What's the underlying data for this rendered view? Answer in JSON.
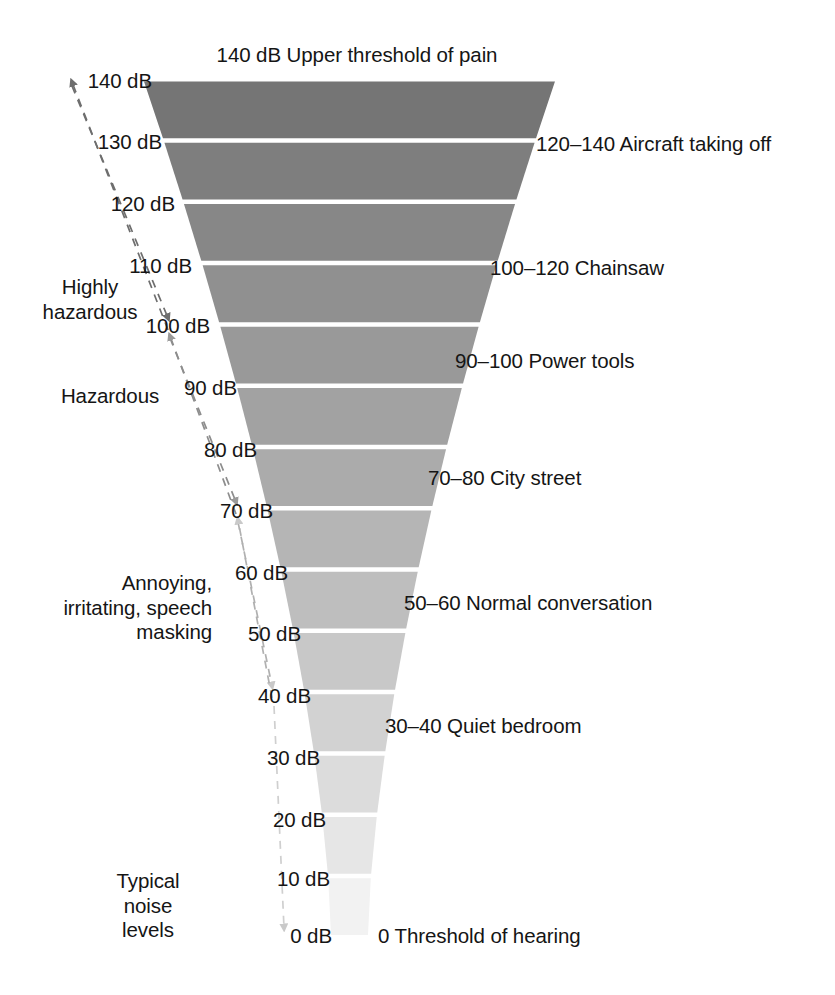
{
  "chart_data": {
    "type": "bar",
    "title": "Typical noise levels",
    "xlabel": "",
    "ylabel": "dB",
    "ylim": [
      0,
      140
    ],
    "grid": false,
    "legend_position": "none",
    "orientation": "funnel",
    "note": "Inverted funnel of sound pressure level bands; band width and darkness scale with decibel level.",
    "categories": [
      "0-10",
      "10-20",
      "20-30",
      "30-40",
      "40-50",
      "50-60",
      "60-70",
      "70-80",
      "80-90",
      "90-100",
      "100-110",
      "110-120",
      "120-130",
      "130-140"
    ],
    "values": [
      10,
      20,
      30,
      40,
      50,
      60,
      70,
      80,
      90,
      100,
      110,
      120,
      130,
      140
    ],
    "tick_labels": [
      "0 dB",
      "10 dB",
      "20 dB",
      "30 dB",
      "40 dB",
      "50 dB",
      "60 dB",
      "70 dB",
      "80 dB",
      "90 dB",
      "100 dB",
      "110 dB",
      "120 dB",
      "130 dB",
      "140 dB"
    ],
    "annotations": [
      "140 dB Upper threshold of pain",
      "120–140 Aircraft taking off",
      "100–120 Chainsaw",
      "90–100 Power tools",
      "70–80 City street",
      "50–60 Normal conversation",
      "30–40 Quiet bedroom",
      "0 Threshold of hearing"
    ],
    "zones": [
      "Highly hazardous",
      "Hazardous",
      "Annoying, irritating, speech masking",
      "Typical noise levels"
    ]
  },
  "top_caption": "140 dB Upper threshold of pain",
  "scale": {
    "ticks": [
      {
        "label": "140 dB",
        "db": 140
      },
      {
        "label": "130 dB",
        "db": 130
      },
      {
        "label": "120 dB",
        "db": 120
      },
      {
        "label": "110 dB",
        "db": 110
      },
      {
        "label": "100 dB",
        "db": 100
      },
      {
        "label": "90 dB",
        "db": 90
      },
      {
        "label": "80 dB",
        "db": 80
      },
      {
        "label": "70 dB",
        "db": 70
      },
      {
        "label": "60 dB",
        "db": 60
      },
      {
        "label": "50 dB",
        "db": 50
      },
      {
        "label": "40 dB",
        "db": 40
      },
      {
        "label": "30 dB",
        "db": 30
      },
      {
        "label": "20 dB",
        "db": 20
      },
      {
        "label": "10 dB",
        "db": 10
      },
      {
        "label": "0 dB",
        "db": 0
      }
    ]
  },
  "descriptors": [
    {
      "label": "120–140 Aircraft taking off"
    },
    {
      "label": "100–120 Chainsaw"
    },
    {
      "label": "90–100 Power tools"
    },
    {
      "label": "70–80 City street"
    },
    {
      "label": "50–60 Normal conversation"
    },
    {
      "label": "30–40 Quiet bedroom"
    },
    {
      "label": "0 Threshold of hearing"
    }
  ],
  "zones": [
    {
      "line1": "Highly",
      "line2": "hazardous"
    },
    {
      "line1": "Hazardous",
      "line2": ""
    },
    {
      "line1": "Annoying,",
      "line2": "irritating, speech",
      "line3": "masking"
    },
    {
      "line1": "Typical",
      "line2": "noise",
      "line3": "levels"
    }
  ],
  "colors": {
    "band_darkest": "#757575",
    "band_lightest": "#f2f2f2",
    "text": "#151515",
    "separator": "#ffffff",
    "arrow_dark": "#6e6e6e",
    "arrow_light": "#c9c9c9",
    "background": "#ffffff"
  }
}
